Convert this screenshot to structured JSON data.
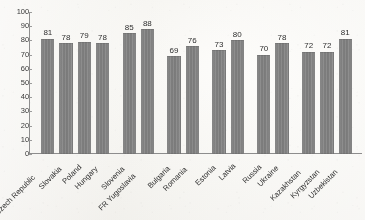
{
  "chart_data": {
    "type": "bar",
    "title": "",
    "subtitle": "",
    "xlabel": "",
    "ylabel": "",
    "ylim": [
      0,
      100
    ],
    "ytick_step": 10,
    "yticks": [
      0,
      10,
      20,
      30,
      40,
      50,
      60,
      70,
      80,
      90,
      100
    ],
    "grid": false,
    "legend": "none",
    "categories": [
      "Czech Republic",
      "Slovakia",
      "Poland",
      "Hungary",
      "Slovenia",
      "FR Yugoslavia",
      "Bulgaria",
      "Romania",
      "Estonia",
      "Latvia",
      "Russia",
      "Ukraine",
      "Kazakhstan",
      "Kyrgyzstan",
      "Uzbekistan"
    ],
    "values": [
      81,
      78,
      79,
      78,
      85,
      88,
      69,
      76,
      73,
      80,
      70,
      78,
      72,
      72,
      81
    ],
    "data_labels": [
      "81",
      "78",
      "79",
      "78",
      "85",
      "88",
      "69",
      "76",
      "73",
      "80",
      "70",
      "78",
      "72",
      "72",
      "81"
    ],
    "groups": [
      {
        "size": 4
      },
      {
        "size": 2
      },
      {
        "size": 2
      },
      {
        "size": 2
      },
      {
        "size": 2
      },
      {
        "size": 3
      }
    ],
    "bar_color": "#828282",
    "axis_color": "#8d8d8d",
    "text_color": "#2e2e2e",
    "background_color": "#f3f2ef"
  }
}
